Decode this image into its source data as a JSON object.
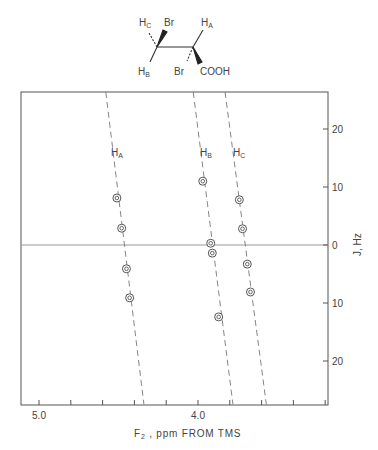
{
  "structure": {
    "labels": {
      "hc": "H",
      "hc_sub": "C",
      "br_top": "Br",
      "ha": "H",
      "ha_sub": "A",
      "hb": "H",
      "hb_sub": "B",
      "br_bottom": "Br",
      "cooh": "COOH"
    }
  },
  "chart_data": {
    "type": "scatter",
    "title": "",
    "xlabel": "F2 , ppm FROM TMS",
    "xlabel_main": "F",
    "xlabel_sub": "2",
    "xlabel_rest": " ,  ppm  FROM  TMS",
    "ylabel": "J, Hz",
    "xlim": [
      5.11,
      3.18
    ],
    "ylim": [
      -27.5,
      26.5
    ],
    "x_reversed": true,
    "x_ticks": [
      5.0,
      4.8,
      4.6,
      4.4,
      4.2,
      4.0,
      3.8,
      3.6,
      3.4,
      3.2
    ],
    "x_tick_labels": [
      {
        "value": 5.0,
        "label": "5.0"
      },
      {
        "value": 4.0,
        "label": "4.0"
      }
    ],
    "y_ticks": [
      20,
      10,
      0,
      -10,
      -20
    ],
    "y_tick_labels": [
      {
        "value": 20,
        "label": "20"
      },
      {
        "value": 10,
        "label": "10"
      },
      {
        "value": 0,
        "label": "0"
      },
      {
        "value": -10,
        "label": "10"
      },
      {
        "value": -20,
        "label": "20"
      }
    ],
    "zero_line": true,
    "grid": false,
    "legend": "none (inline labels)",
    "series": [
      {
        "name": "HA",
        "label_main": "H",
        "label_sub": "A",
        "points": [
          [
            4.51,
            8.1
          ],
          [
            4.48,
            2.9
          ],
          [
            4.45,
            -4.1
          ],
          [
            4.43,
            -9.1
          ]
        ],
        "fit_line": [
          [
            4.58,
            26.5
          ],
          [
            4.34,
            -27.5
          ]
        ]
      },
      {
        "name": "HB",
        "label_main": "H",
        "label_sub": "B",
        "points": [
          [
            3.97,
            11.0
          ],
          [
            3.92,
            0.3
          ],
          [
            3.91,
            -1.4
          ],
          [
            3.87,
            -12.4
          ]
        ],
        "fit_line": [
          [
            4.03,
            26.5
          ],
          [
            3.78,
            -27.5
          ]
        ]
      },
      {
        "name": "HC",
        "label_main": "H",
        "label_sub": "C",
        "points": [
          [
            3.74,
            7.8
          ],
          [
            3.72,
            2.8
          ],
          [
            3.69,
            -3.3
          ],
          [
            3.67,
            -8.1
          ]
        ],
        "fit_line": [
          [
            3.83,
            26.5
          ],
          [
            3.57,
            -27.5
          ]
        ]
      }
    ]
  }
}
